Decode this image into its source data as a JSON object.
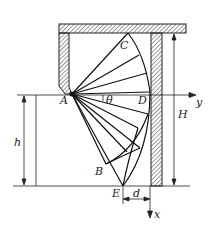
{
  "diagram": {
    "labels": {
      "A": "A",
      "B": "B",
      "C": "C",
      "D": "D",
      "E": "E",
      "theta": "θ",
      "h": "h",
      "H": "H",
      "d": "d",
      "x_axis": "x",
      "y_axis": "y"
    },
    "colors": {
      "line": "#1a1a1a",
      "background": "#ffffff"
    }
  }
}
